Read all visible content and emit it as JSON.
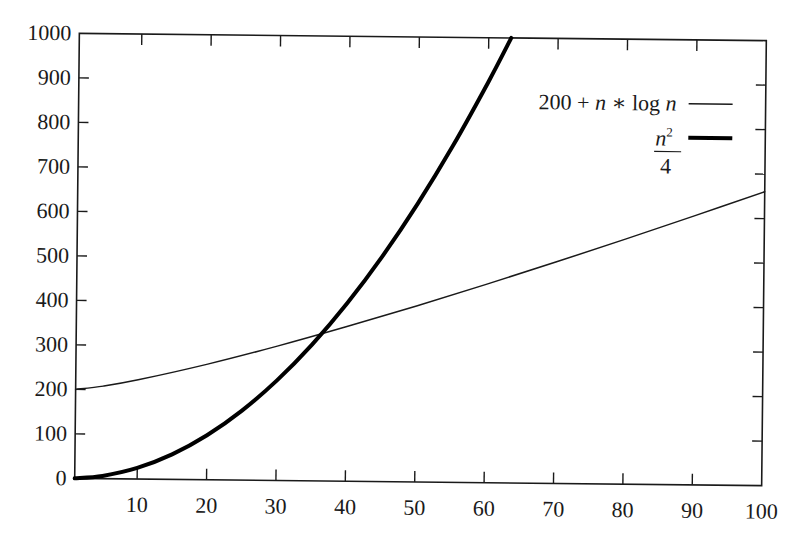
{
  "chart_data": {
    "type": "line",
    "title": "",
    "xlabel": "",
    "ylabel": "",
    "xlim": [
      1,
      100
    ],
    "ylim": [
      0,
      1000
    ],
    "grid": false,
    "legend_position": "upper right",
    "x_ticks": [
      10,
      20,
      30,
      40,
      50,
      60,
      70,
      80,
      90,
      100
    ],
    "x_tick_labels": [
      "10",
      "20",
      "30",
      "40",
      "50",
      "60",
      "70",
      "80",
      "90",
      "100"
    ],
    "y_ticks": [
      0,
      100,
      200,
      300,
      400,
      500,
      600,
      700,
      800,
      900,
      1000
    ],
    "y_tick_labels": [
      "0",
      "100",
      "200",
      "300",
      "400",
      "500",
      "600",
      "700",
      "800",
      "900",
      "1000"
    ],
    "series": [
      {
        "name": "200 + n * log n",
        "style": "thin",
        "x": [
          1,
          5,
          10,
          20,
          30,
          40,
          50,
          60,
          70,
          80,
          90,
          100
        ],
        "values": [
          200,
          208.0,
          223.0,
          259.9,
          302.0,
          347.6,
          395.6,
          445.7,
          497.4,
          550.6,
          605.0,
          660.5
        ]
      },
      {
        "name": "n^2/4",
        "style": "thick",
        "x": [
          1,
          5,
          10,
          15,
          20,
          25,
          30,
          35,
          40,
          45,
          50,
          55,
          60,
          63.25
        ],
        "values": [
          0.25,
          6.25,
          25,
          56.25,
          100,
          156.25,
          225,
          306.25,
          400,
          506.25,
          625,
          756.25,
          900,
          1000
        ]
      }
    ],
    "annotations": [
      {
        "text": "curves intersect near n ≈ 37, y ≈ 340"
      }
    ]
  },
  "legend": {
    "series1": {
      "prefix": "200 + ",
      "n1": "n",
      "op": " ∗ log ",
      "n2": "n"
    },
    "series2": {
      "numerator_base": "n",
      "numerator_exp": "2",
      "denominator": "4"
    }
  }
}
